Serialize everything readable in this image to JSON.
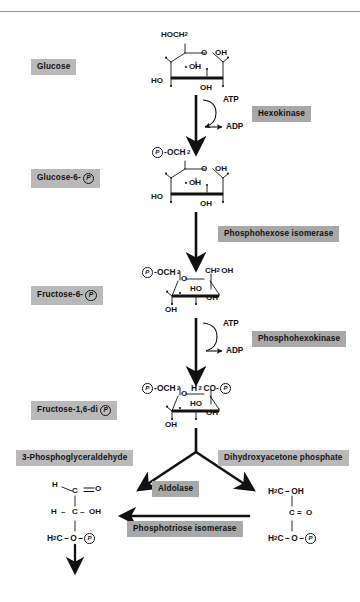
{
  "diagram": {
    "type": "metabolic-pathway-flowchart"
  },
  "metabolites": [
    {
      "id": "glucose",
      "label": "Glucose",
      "has_p": false
    },
    {
      "id": "glucose6p",
      "label": "Glucose-6-",
      "has_p": true
    },
    {
      "id": "fructose6p",
      "label": "Fructose-6-",
      "has_p": true
    },
    {
      "id": "fructose16dip",
      "label": "Fructose-1,6-di",
      "has_p": true
    },
    {
      "id": "g3p",
      "label": "3-Phosphoglyceraldehyde",
      "has_p": false
    },
    {
      "id": "dhap",
      "label": "Dihydroxyacetone phosphate",
      "has_p": false
    }
  ],
  "enzymes": [
    {
      "id": "hexokinase",
      "label": "Hexokinase"
    },
    {
      "id": "phosphohexose-isomerase",
      "label": "Phosphohexose isomerase"
    },
    {
      "id": "phosphohexokinase",
      "label": "Phosphohexokinase"
    },
    {
      "id": "aldolase",
      "label": "Aldolase"
    },
    {
      "id": "phosphotriose-isomerase",
      "label": "Phosphotriose isomerase"
    }
  ],
  "cofactors": [
    {
      "id": "atp1",
      "label": "ATP"
    },
    {
      "id": "adp1",
      "label": "ADP"
    },
    {
      "id": "atp2",
      "label": "ATP"
    },
    {
      "id": "adp2",
      "label": "ADP"
    }
  ],
  "structures": {
    "glucose": {
      "name": "alpha-D-glucopyranose Haworth ring",
      "c6": "HOCH",
      "c6_sub": "2",
      "ring_o": "O",
      "oh_anomeric": "OH",
      "oh_c2": "OH",
      "ho_c4": "HO",
      "oh_c3": "OH"
    },
    "glucose6p": {
      "name": "glucose-6-phosphate Haworth ring",
      "c6_pre": "-OCH",
      "c6_sub": "2",
      "ring_o": "O",
      "oh_anomeric": "OH",
      "oh_c2": "OH",
      "ho_c4": "HO",
      "oh_c3": "OH"
    },
    "fructose6p": {
      "name": "fructose-6-phosphate furanose ring",
      "c6_pre": "-OCH",
      "c6_sub": "2",
      "ring_o": "O",
      "c1": "CH",
      "c1_sub": "2",
      "c1_post": "OH",
      "ho": "HO",
      "oh_right": "OH",
      "oh_bottom": "OH"
    },
    "fructose16dip": {
      "name": "fructose-1,6-bisphosphate furanose ring",
      "c6_pre": "-OCH",
      "c6_sub": "2",
      "ring_o": "O",
      "c1_pre": "H",
      "c1_sub": "2",
      "c1_post": "CO-",
      "ho": "HO",
      "oh_right": "OH",
      "oh_bottom": "OH"
    },
    "g3p": {
      "name": "3-phosphoglyceraldehyde open chain",
      "row1_left": "H",
      "row1_c": "C",
      "row1_right": "O",
      "row2_left": "H",
      "row2_c": "C",
      "row2_right": "OH",
      "row3_left": "H",
      "row3_sub": "2",
      "row3_c": "C",
      "row3_o": "O"
    },
    "dhap": {
      "name": "dihydroxyacetone phosphate open chain",
      "row1_left": "H",
      "row1_sub": "2",
      "row1_c": "C",
      "row1_right": "OH",
      "row2_c": "C",
      "row2_right": "O",
      "row3_left": "H",
      "row3_sub": "2",
      "row3_c": "C",
      "row3_o": "O"
    }
  },
  "colors": {
    "chip_metabolite": "#b9b9b9",
    "chip_enzyme": "#a8a8a8",
    "ink": "#111111",
    "rule": "#9a9a9a",
    "background": "#ffffff"
  }
}
